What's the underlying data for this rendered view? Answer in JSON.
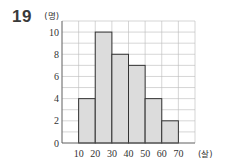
{
  "problem_number": "19",
  "chart_data": {
    "type": "bar",
    "subtype": "histogram",
    "title": "",
    "xlabel": "(살)",
    "ylabel": "(명)",
    "bins": [
      [
        10,
        20
      ],
      [
        20,
        30
      ],
      [
        30,
        40
      ],
      [
        40,
        50
      ],
      [
        50,
        60
      ],
      [
        60,
        70
      ]
    ],
    "categories": [
      "10-20",
      "20-30",
      "30-40",
      "40-50",
      "50-60",
      "60-70"
    ],
    "values": [
      4,
      10,
      8,
      7,
      4,
      2
    ],
    "x_ticks": [
      "10",
      "20",
      "30",
      "40",
      "50",
      "60",
      "70"
    ],
    "y_ticks": [
      "0",
      "2",
      "4",
      "6",
      "8",
      "10"
    ],
    "xlim": [
      0,
      80
    ],
    "ylim": [
      0,
      11
    ],
    "grid": true,
    "bar_fill": "#dcdcdc",
    "bar_edge": "#333333",
    "grid_color": "#bbbbbb"
  }
}
